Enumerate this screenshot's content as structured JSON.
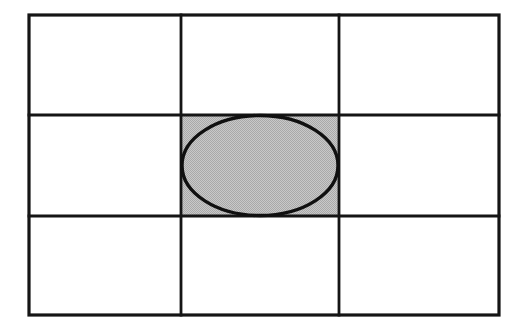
{
  "figure": {
    "title": "Grid with inscribed shaded ellipse",
    "canvas": {
      "width": 519,
      "height": 332,
      "background": "#ffffff"
    },
    "colors": {
      "line": "#151515",
      "ellipse_stroke": "#101010",
      "shade_fill": "#b9b9b9",
      "shade_fill_alt": "#c6c6c6",
      "background": "#ffffff"
    },
    "outer_rect": {
      "x": 29,
      "y": 15,
      "width": 470,
      "height": 300,
      "stroke_width": 3.2
    },
    "grid": {
      "rows": 3,
      "cols": 3,
      "col_edges": [
        29,
        181,
        339,
        499
      ],
      "row_edges": [
        15,
        115,
        216,
        315
      ],
      "col_widths": [
        152,
        158,
        160
      ],
      "row_heights": [
        100,
        101,
        99
      ],
      "inner_stroke_width": 2.8
    },
    "cells": [
      {
        "id": "cell-r0-c0",
        "row": 0,
        "col": 0,
        "shaded": false,
        "label": ""
      },
      {
        "id": "cell-r0-c1",
        "row": 0,
        "col": 1,
        "shaded": false,
        "label": ""
      },
      {
        "id": "cell-r0-c2",
        "row": 0,
        "col": 2,
        "shaded": false,
        "label": ""
      },
      {
        "id": "cell-r1-c0",
        "row": 1,
        "col": 0,
        "shaded": false,
        "label": ""
      },
      {
        "id": "cell-r1-c1",
        "row": 1,
        "col": 1,
        "shaded": true,
        "label": ""
      },
      {
        "id": "cell-r1-c2",
        "row": 1,
        "col": 2,
        "shaded": false,
        "label": ""
      },
      {
        "id": "cell-r2-c0",
        "row": 2,
        "col": 0,
        "shaded": false,
        "label": ""
      },
      {
        "id": "cell-r2-c1",
        "row": 2,
        "col": 1,
        "shaded": false,
        "label": ""
      },
      {
        "id": "cell-r2-c2",
        "row": 2,
        "col": 2,
        "shaded": false,
        "label": ""
      }
    ],
    "shaded_region": {
      "x": 181,
      "y": 115,
      "width": 158,
      "height": 101
    },
    "ellipse": {
      "cx": 260,
      "cy": 165.5,
      "rx": 78,
      "ry": 50,
      "stroke_width": 3.4,
      "fill": "none",
      "inscribed_in": "cell-r1-c1"
    }
  }
}
